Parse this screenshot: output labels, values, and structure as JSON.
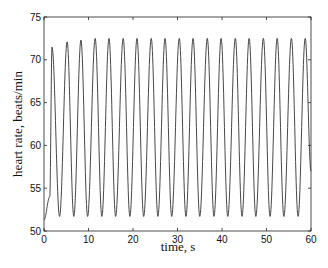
{
  "chart_data": {
    "type": "line",
    "title": "",
    "xlabel": "time, s",
    "ylabel": "heart rate, beats/min",
    "xlim": [
      0,
      60
    ],
    "ylim": [
      50,
      75
    ],
    "xticks": [
      0,
      10,
      20,
      30,
      40,
      50,
      60
    ],
    "yticks": [
      50,
      55,
      60,
      65,
      70,
      75
    ],
    "grid": false,
    "legend": null,
    "line_color": "#333333",
    "series": [
      {
        "name": "heart rate",
        "description": "Periodic oscillation with period ~3.15 s; starts at ~51.3, rises to first peak ~71.5, later peaks settle ~72.5, minima ~51.7",
        "start": {
          "t": 0,
          "value": 51.3
        },
        "peaks": [
          {
            "t": 1.8,
            "value": 71.5
          },
          {
            "t": 5.2,
            "value": 72.1
          },
          {
            "t": 8.3,
            "value": 72.3
          },
          {
            "t": 11.5,
            "value": 72.5
          },
          {
            "t": 14.6,
            "value": 72.5
          },
          {
            "t": 17.8,
            "value": 72.5
          },
          {
            "t": 20.9,
            "value": 72.5
          },
          {
            "t": 24.1,
            "value": 72.5
          },
          {
            "t": 27.2,
            "value": 72.5
          },
          {
            "t": 30.4,
            "value": 72.5
          },
          {
            "t": 33.5,
            "value": 72.5
          },
          {
            "t": 36.7,
            "value": 72.5
          },
          {
            "t": 39.8,
            "value": 72.5
          },
          {
            "t": 43.0,
            "value": 72.5
          },
          {
            "t": 46.1,
            "value": 72.5
          },
          {
            "t": 49.3,
            "value": 72.5
          },
          {
            "t": 52.4,
            "value": 72.5
          },
          {
            "t": 55.6,
            "value": 72.5
          },
          {
            "t": 58.7,
            "value": 72.5
          }
        ],
        "minima": [
          {
            "t": 3.5,
            "value": 51.7
          },
          {
            "t": 6.7,
            "value": 51.7
          },
          {
            "t": 9.8,
            "value": 51.7
          },
          {
            "t": 13.0,
            "value": 51.7
          },
          {
            "t": 16.1,
            "value": 51.7
          },
          {
            "t": 19.3,
            "value": 51.7
          },
          {
            "t": 22.4,
            "value": 51.7
          },
          {
            "t": 25.6,
            "value": 51.7
          },
          {
            "t": 28.7,
            "value": 51.7
          },
          {
            "t": 31.9,
            "value": 51.7
          },
          {
            "t": 35.0,
            "value": 51.7
          },
          {
            "t": 38.2,
            "value": 51.7
          },
          {
            "t": 41.3,
            "value": 51.7
          },
          {
            "t": 44.5,
            "value": 51.7
          },
          {
            "t": 47.6,
            "value": 51.7
          },
          {
            "t": 50.8,
            "value": 51.7
          },
          {
            "t": 53.9,
            "value": 51.7
          },
          {
            "t": 57.1,
            "value": 51.7
          }
        ],
        "end": {
          "t": 60,
          "value": 57.0
        }
      }
    ]
  },
  "plot": {
    "xlabel": "time, s",
    "ylabel": "heart rate, beats/min"
  }
}
